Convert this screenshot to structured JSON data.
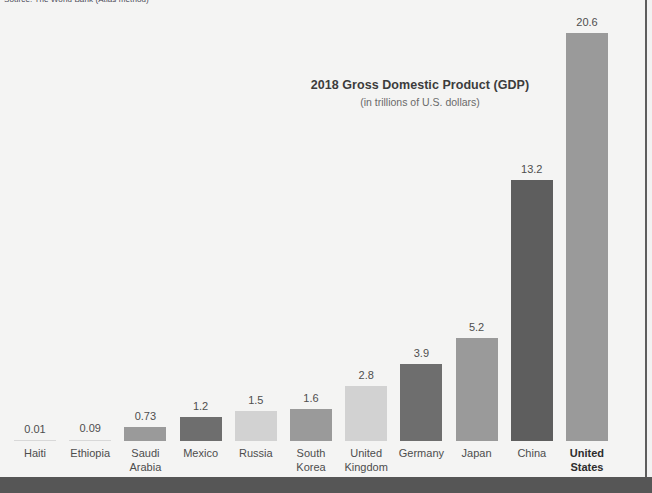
{
  "source_credit": "Source: The World Bank (Atlas method)",
  "title": "2018 Gross Domestic Product (GDP)",
  "subtitle": "(in trillions of U.S. dollars)",
  "colors": {
    "background": "#f4f4f3",
    "footer_band": "#565656",
    "right_rule": "#5d5d5d",
    "bar_medium": "#9a9a9a",
    "bar_dark": "#6e6e6e",
    "bar_light": "#d2d2d2",
    "value_text": "#4e4e4e",
    "label_text": "#4d4d4d",
    "title_text": "#3c3c3c",
    "subtitle_text": "#6a6a6a"
  },
  "chart_data": {
    "type": "bar",
    "title": "2018 Gross Domestic Product (GDP)",
    "subtitle": "(in trillions of U.S. dollars)",
    "xlabel": "",
    "ylabel": "GDP (trillions of U.S. dollars)",
    "ylim": [
      0,
      20.6
    ],
    "grid": false,
    "legend": "none",
    "categories": [
      "Haiti",
      "Ethiopia",
      "Saudi Arabia",
      "Mexico",
      "Russia",
      "South Korea",
      "United Kingdom",
      "Germany",
      "Japan",
      "China",
      "United States"
    ],
    "values": [
      0.01,
      0.09,
      0.73,
      1.2,
      1.5,
      1.6,
      2.8,
      3.9,
      5.2,
      13.2,
      20.6
    ],
    "value_labels": [
      "0.01",
      "0.09",
      "0.73",
      "1.2",
      "1.5",
      "1.6",
      "2.8",
      "3.9",
      "5.2",
      "13.2",
      "20.6"
    ],
    "bars": [
      {
        "label": "Haiti",
        "label_line1": "Haiti",
        "label_line2": "",
        "value": 0.01,
        "value_label": "0.01",
        "color": "#d2d2d2",
        "highlight": false
      },
      {
        "label": "Ethiopia",
        "label_line1": "Ethiopia",
        "label_line2": "",
        "value": 0.09,
        "value_label": "0.09",
        "color": "#d2d2d2",
        "highlight": false
      },
      {
        "label": "Saudi Arabia",
        "label_line1": "Saudi",
        "label_line2": "Arabia",
        "value": 0.73,
        "value_label": "0.73",
        "color": "#9a9a9a",
        "highlight": false
      },
      {
        "label": "Mexico",
        "label_line1": "Mexico",
        "label_line2": "",
        "value": 1.2,
        "value_label": "1.2",
        "color": "#6e6e6e",
        "highlight": false
      },
      {
        "label": "Russia",
        "label_line1": "Russia",
        "label_line2": "",
        "value": 1.5,
        "value_label": "1.5",
        "color": "#d2d2d2",
        "highlight": false
      },
      {
        "label": "South Korea",
        "label_line1": "South",
        "label_line2": "Korea",
        "value": 1.6,
        "value_label": "1.6",
        "color": "#9a9a9a",
        "highlight": false
      },
      {
        "label": "United Kingdom",
        "label_line1": "United",
        "label_line2": "Kingdom",
        "value": 2.8,
        "value_label": "2.8",
        "color": "#d2d2d2",
        "highlight": false
      },
      {
        "label": "Germany",
        "label_line1": "Germany",
        "label_line2": "",
        "value": 3.9,
        "value_label": "3.9",
        "color": "#6e6e6e",
        "highlight": false
      },
      {
        "label": "Japan",
        "label_line1": "Japan",
        "label_line2": "",
        "value": 5.2,
        "value_label": "5.2",
        "color": "#9a9a9a",
        "highlight": false
      },
      {
        "label": "China",
        "label_line1": "China",
        "label_line2": "",
        "value": 13.2,
        "value_label": "13.2",
        "color": "#5e5e5e",
        "highlight": false
      },
      {
        "label": "United States",
        "label_line1": "United",
        "label_line2": "States",
        "value": 20.6,
        "value_label": "20.6",
        "color": "#9a9a9a",
        "highlight": true
      }
    ]
  }
}
